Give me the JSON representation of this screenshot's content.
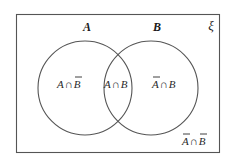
{
  "diagram": {
    "type": "venn",
    "universe": {
      "label": "ξ",
      "x": 16,
      "y": 14,
      "width": 203,
      "height": 138,
      "stroke": "#555555"
    },
    "sets": [
      {
        "name": "A",
        "label": "A",
        "cx": 85,
        "cy": 88,
        "r": 47,
        "stroke": "#555555"
      },
      {
        "name": "B",
        "label": "B",
        "cx": 151,
        "cy": 88,
        "r": 47,
        "stroke": "#555555"
      }
    ],
    "regions": [
      {
        "id": "a-only",
        "label": "A∩B̄",
        "parts": [
          "A",
          "∩",
          "B"
        ],
        "bar_on": [
          "B"
        ]
      },
      {
        "id": "a-and-b",
        "label": "A∩B",
        "parts": [
          "A",
          "∩",
          "B"
        ],
        "bar_on": []
      },
      {
        "id": "b-only",
        "label": "Ā∩B",
        "parts": [
          "A",
          "∩",
          "B"
        ],
        "bar_on": [
          "A"
        ]
      },
      {
        "id": "neither",
        "label": "Ā∩B̄",
        "parts": [
          "A",
          "∩",
          "B"
        ],
        "bar_on": [
          "A",
          "B"
        ]
      }
    ]
  }
}
